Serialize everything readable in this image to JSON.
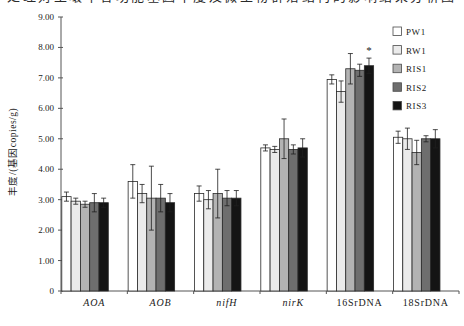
{
  "top_caption_fragment": "处理对土壤中各功能基因丰度及微生物群落结构的影响结果分析图",
  "chart_data": {
    "type": "bar",
    "title": "",
    "xlabel": "",
    "ylabel": "丰度/(基因copies/g)",
    "ylim": [
      0,
      9
    ],
    "ytick_step": 1,
    "ytick_labels": [
      "0",
      "1.00",
      "2.00",
      "3.00",
      "4.00",
      "5.00",
      "6.00",
      "7.00",
      "8.00",
      "9.00"
    ],
    "grid": false,
    "legend_position": "top-right",
    "categories": [
      "AOA",
      "AOB",
      "nifH",
      "nirK",
      "16SrDNA",
      "18SrDNA"
    ],
    "categories_italic": [
      true,
      true,
      true,
      true,
      false,
      false
    ],
    "series": [
      {
        "name": "PW1",
        "color": "#ffffff",
        "values": [
          3.1,
          3.6,
          3.2,
          4.7,
          6.95,
          5.05
        ],
        "errors": [
          0.15,
          0.55,
          0.25,
          0.1,
          0.15,
          0.2
        ]
      },
      {
        "name": "RW1",
        "color": "#ebebeb",
        "values": [
          2.95,
          3.2,
          3.0,
          4.65,
          6.55,
          5.0
        ],
        "errors": [
          0.1,
          0.3,
          0.3,
          0.1,
          0.35,
          0.35
        ]
      },
      {
        "name": "RIS1",
        "color": "#b3b3b3",
        "values": [
          2.85,
          3.05,
          3.2,
          5.0,
          7.3,
          4.55
        ],
        "errors": [
          0.1,
          1.05,
          0.8,
          0.65,
          0.5,
          0.4
        ]
      },
      {
        "name": "RIS2",
        "color": "#6e6e6e",
        "values": [
          2.9,
          3.05,
          3.05,
          4.65,
          7.25,
          5.0
        ],
        "errors": [
          0.3,
          0.45,
          0.25,
          0.15,
          0.2,
          0.1
        ]
      },
      {
        "name": "RIS3",
        "color": "#141414",
        "values": [
          2.9,
          2.9,
          3.05,
          4.7,
          7.4,
          5.0
        ],
        "errors": [
          0.15,
          0.3,
          0.25,
          0.3,
          0.25,
          0.3
        ]
      }
    ],
    "annotations": [
      {
        "text": "*",
        "category": "16SrDNA",
        "series": "RIS3"
      }
    ],
    "bar_border_color": "#2a2a2a",
    "error_bar_color": "#1f1f1f",
    "axis_color": "#555555"
  }
}
